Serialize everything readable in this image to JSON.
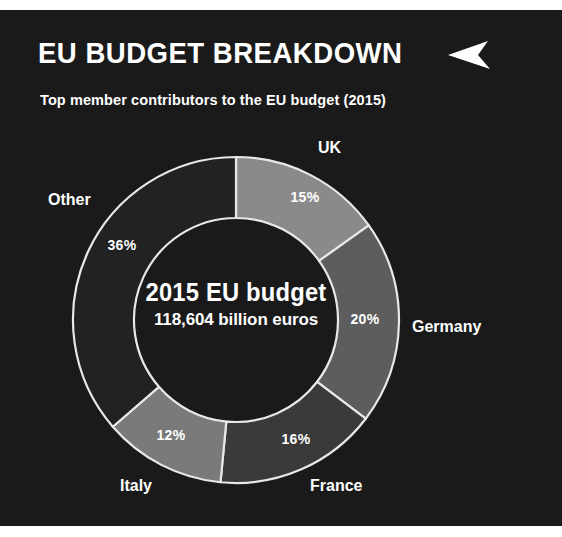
{
  "header": {
    "title": "EU BUDGET BREAKDOWN",
    "arrow_icon": "play-arrow-left-icon",
    "subtitle": "Top member contributors to the EU budget (2015)"
  },
  "center": {
    "line1": "2015 EU budget",
    "line2": "118,604 billion euros"
  },
  "colors": {
    "background": "#1a1a1a",
    "page": "#ffffff",
    "text": "#ffffff",
    "slice_stroke": "#e8e8e8",
    "uk": "#8a8a8a",
    "germany": "#5d5d5d",
    "france": "#3a3a3a",
    "italy": "#7a7a7a",
    "other": "#222222"
  },
  "chart_data": {
    "type": "pie",
    "variant": "donut",
    "title": "EU BUDGET BREAKDOWN",
    "subtitle": "Top member contributors to the EU budget (2015)",
    "center_label": "2015 EU budget",
    "center_value": "118,604 billion euros",
    "total_budget_billion_euros": 118604,
    "unit": "%",
    "legend": "labels placed outside slices",
    "categories": [
      "UK",
      "Germany",
      "France",
      "Italy",
      "Other"
    ],
    "values": [
      15,
      20,
      16,
      12,
      36
    ],
    "labels": [
      "15%",
      "20%",
      "16%",
      "12%",
      "36%"
    ],
    "start_angle_deg": 0,
    "direction": "clockwise",
    "slices": [
      {
        "name": "UK",
        "value": 15,
        "label": "15%",
        "color": "#8a8a8a",
        "pct_x": 305,
        "pct_y": 188,
        "cat_x": 318,
        "cat_y": 129
      },
      {
        "name": "Germany",
        "value": 20,
        "label": "20%",
        "color": "#5d5d5d",
        "pct_x": 365,
        "pct_y": 310,
        "cat_x": 412,
        "cat_y": 308
      },
      {
        "name": "France",
        "value": 16,
        "label": "16%",
        "color": "#3a3a3a",
        "pct_x": 296,
        "pct_y": 430,
        "cat_x": 310,
        "cat_y": 467
      },
      {
        "name": "Italy",
        "value": 12,
        "label": "12%",
        "color": "#7a7a7a",
        "pct_x": 171,
        "pct_y": 426,
        "cat_x": 120,
        "cat_y": 467
      },
      {
        "name": "Other",
        "value": 36,
        "label": "36%",
        "color": "#222222",
        "pct_x": 122,
        "pct_y": 236,
        "cat_x": 48,
        "cat_y": 181
      }
    ]
  }
}
